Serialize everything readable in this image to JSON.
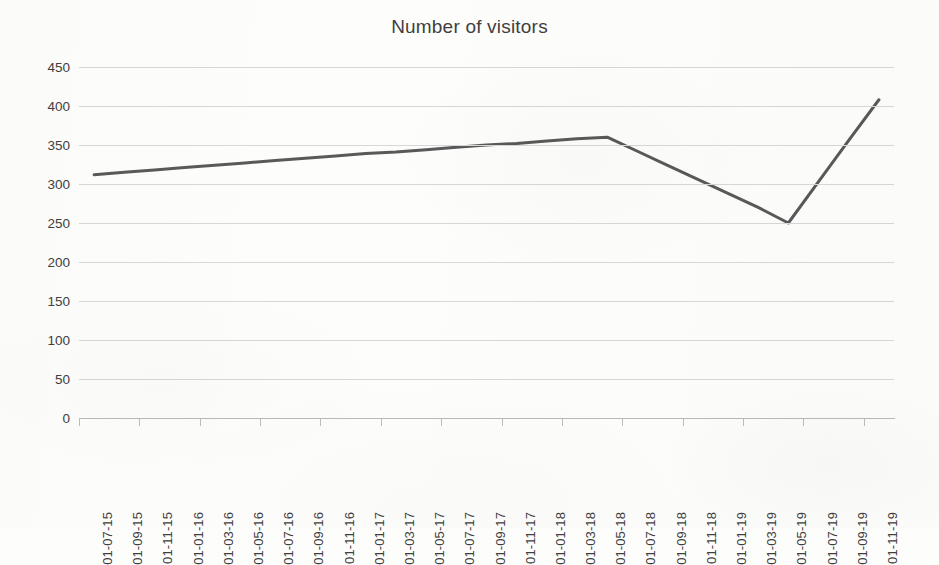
{
  "chart_data": {
    "type": "line",
    "title": "Number of visitors",
    "xlabel": "",
    "ylabel": "",
    "ylim": [
      0,
      450
    ],
    "ytick_step": 50,
    "yticks": [
      0,
      50,
      100,
      150,
      200,
      250,
      300,
      350,
      400,
      450
    ],
    "ytick_labels": [
      "0",
      "50",
      "100",
      "150",
      "200",
      "250",
      "300",
      "350",
      "400",
      "450"
    ],
    "grid": "horizontal",
    "legend": "none",
    "line_color": "#595959",
    "line_width_px": 3,
    "markers": "none",
    "categories": [
      "01-07-15",
      "01-09-15",
      "01-11-15",
      "01-01-16",
      "01-03-16",
      "01-05-16",
      "01-07-16",
      "01-09-16",
      "01-11-16",
      "01-01-17",
      "01-03-17",
      "01-05-17",
      "01-07-17",
      "01-09-17",
      "01-11-17",
      "01-01-18",
      "01-03-18",
      "01-05-18",
      "01-07-18",
      "01-09-18",
      "01-11-18",
      "01-01-19",
      "01-03-19",
      "01-05-19",
      "01-07-19",
      "01-09-19",
      "01-11-19"
    ],
    "values": [
      312,
      315,
      318,
      321,
      324,
      327,
      330,
      333,
      336,
      339,
      341,
      344,
      347,
      350,
      352,
      355,
      358,
      360,
      342,
      324,
      306,
      288,
      270,
      250,
      303,
      356,
      408
    ],
    "series": [
      {
        "name": "Number of visitors",
        "values": [
          312,
          315,
          318,
          321,
          324,
          327,
          330,
          333,
          336,
          339,
          341,
          344,
          347,
          350,
          352,
          355,
          358,
          360,
          342,
          324,
          306,
          288,
          270,
          250,
          303,
          356,
          408
        ]
      }
    ],
    "vertices": [
      {
        "category": "01-07-15",
        "value": 312
      },
      {
        "category": "01-05-18",
        "value": 360
      },
      {
        "category": "01-05-19",
        "value": 250
      },
      {
        "category": "01-11-19",
        "value": 408
      }
    ],
    "annotations": []
  },
  "colors": {
    "line": "#595959",
    "gridline": "#d7d7d7",
    "axis": "#b9b9b9",
    "text": "#3f3f3f",
    "background": "#fdfdfc"
  }
}
